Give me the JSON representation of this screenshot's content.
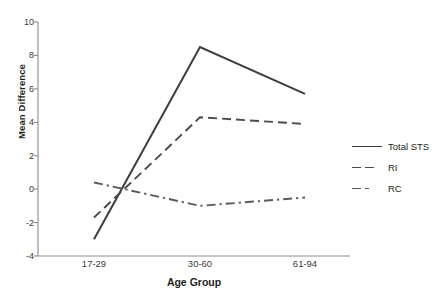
{
  "chart_data": {
    "type": "line",
    "title": "",
    "xlabel": "Age Group",
    "ylabel": "Mean Difference",
    "categories": [
      "17-29",
      "30-60",
      "61-94"
    ],
    "ylim": [
      -4,
      10
    ],
    "yticks": [
      -4,
      -2,
      0,
      2,
      4,
      6,
      8,
      10
    ],
    "ytick_labels": [
      "-4",
      "-2",
      "0",
      "2",
      "4",
      "6",
      "8",
      "10"
    ],
    "grid": false,
    "legend_position": "right",
    "series": [
      {
        "name": "Total STS",
        "values": [
          -3.0,
          8.5,
          5.7
        ],
        "style": "solid",
        "color": "#3d3d3d"
      },
      {
        "name": "RI",
        "values": [
          -1.7,
          4.3,
          3.9
        ],
        "style": "dashed",
        "color": "#4a4a4a"
      },
      {
        "name": "RC",
        "values": [
          0.4,
          -1.0,
          -0.5
        ],
        "style": "dashdot",
        "color": "#5a5a5a"
      }
    ]
  },
  "legend": {
    "items": [
      {
        "label": "Total STS"
      },
      {
        "label": "RI"
      },
      {
        "label": "RC"
      }
    ]
  },
  "axes": {
    "y_title": "Mean Difference",
    "x_title": "Age Group"
  }
}
